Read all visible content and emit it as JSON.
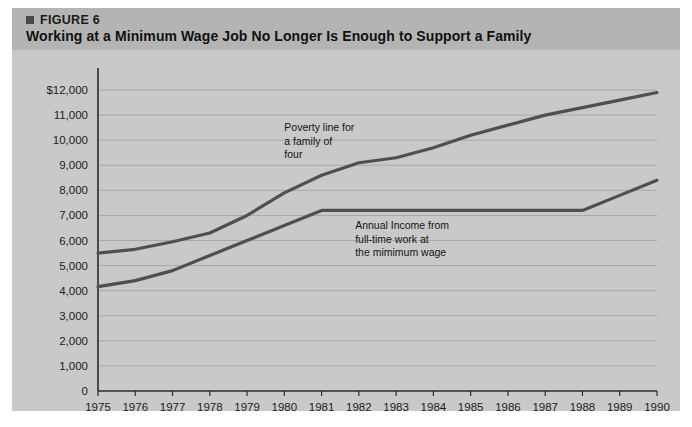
{
  "figure": {
    "eyebrow": "FIGURE 6",
    "title": "Working at a Minimum Wage Job No Longer Is Enough to Support a Family",
    "marker_icon": "square-bullet-icon",
    "header_bg": "#b4b4b4",
    "panel_bg": "#c9c9c9"
  },
  "chart_data": {
    "type": "line",
    "title": "Working at a Minimum Wage Job No Longer Is Enough to Support a Family",
    "xlabel": "",
    "ylabel": "",
    "x": [
      1975,
      1976,
      1977,
      1978,
      1979,
      1980,
      1981,
      1982,
      1983,
      1984,
      1985,
      1986,
      1987,
      1988,
      1989,
      1990
    ],
    "xtick_labels": [
      "1975",
      "1976",
      "1977",
      "1978",
      "1979",
      "1980",
      "1981",
      "1982",
      "1983",
      "1984",
      "1985",
      "1986",
      "1987",
      "1988",
      "1989",
      "1990"
    ],
    "ytick_labels": [
      "$12,000",
      "11,000",
      "10,000",
      "9,000",
      "8,000",
      "7,000",
      "6,000",
      "5,000",
      "4,000",
      "3,000",
      "2,000",
      "1,000",
      "0"
    ],
    "ytick_values": [
      12000,
      11000,
      10000,
      9000,
      8000,
      7000,
      6000,
      5000,
      4000,
      3000,
      2000,
      1000,
      0
    ],
    "ylim": [
      0,
      12400
    ],
    "xlim": [
      1975,
      1990
    ],
    "grid": true,
    "legend_position": "inline-annotations",
    "series": [
      {
        "name": "Poverty line for a family of four",
        "color": "#4f4f4f",
        "values": [
          5500,
          5650,
          5950,
          6300,
          7000,
          7900,
          8600,
          9100,
          9300,
          9700,
          10200,
          10600,
          11000,
          11300,
          11600,
          11900
        ]
      },
      {
        "name": "Annual Income from full-time work at the mimimum wage",
        "color": "#4f4f4f",
        "values": [
          4160,
          4400,
          4800,
          5400,
          6000,
          6600,
          7200,
          7200,
          7200,
          7200,
          7200,
          7200,
          7200,
          7200,
          7800,
          8400
        ]
      }
    ],
    "annotations": [
      {
        "id": "poverty-annotation",
        "lines": [
          "Poverty line for",
          "a family of",
          "four"
        ],
        "x": 1980.0,
        "y": 10350
      },
      {
        "id": "minimum-wage-annotation",
        "lines": [
          "Annual Income from",
          "full-time work at",
          "the mimimum wage"
        ],
        "x": 1981.9,
        "y": 6450
      }
    ]
  },
  "footer": {
    "artifact_text": ""
  }
}
